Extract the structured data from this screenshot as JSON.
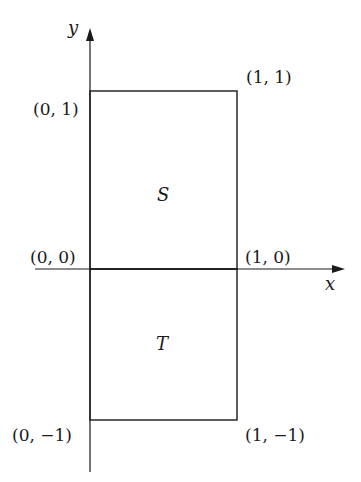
{
  "diagram": {
    "axes": {
      "x_label": "x",
      "y_label": "y"
    },
    "regions": [
      {
        "name": "S",
        "label": "S",
        "corners": [
          [
            0,
            0
          ],
          [
            1,
            0
          ],
          [
            1,
            1
          ],
          [
            0,
            1
          ]
        ]
      },
      {
        "name": "T",
        "label": "T",
        "corners": [
          [
            0,
            -1
          ],
          [
            1,
            -1
          ],
          [
            1,
            0
          ],
          [
            0,
            0
          ]
        ]
      }
    ],
    "point_labels": {
      "p01": "(0, 1)",
      "p11": "(1, 1)",
      "p00": "(0, 0)",
      "p10": "(1, 0)",
      "p0m1": "(0, −1)",
      "p1m1": "(1, −1)"
    },
    "colors": {
      "line": "#1a1a1a",
      "background": "#ffffff"
    }
  }
}
